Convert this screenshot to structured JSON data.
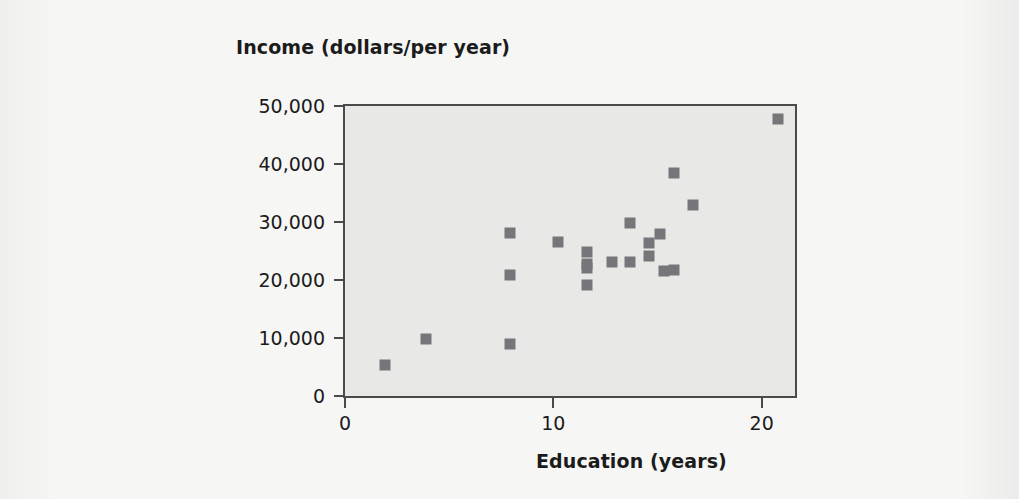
{
  "chart_data": {
    "type": "scatter",
    "title": "Income (dollars/per year)",
    "xlabel": "Education (years)",
    "ylabel": "Income (dollars/per year)",
    "xlim": [
      0,
      21.6
    ],
    "ylim": [
      0,
      50000
    ],
    "grid": false,
    "legend": null,
    "marker": "square",
    "marker_color": "#76767a",
    "plot_background": "#e8e8e7",
    "axis_color": "#4a4a4a",
    "xticks": [
      {
        "value": 0,
        "label": "0"
      },
      {
        "value": 10,
        "label": "10"
      },
      {
        "value": 20,
        "label": "20"
      }
    ],
    "yticks": [
      {
        "value": 0,
        "label": "0"
      },
      {
        "value": 10000,
        "label": "10,000"
      },
      {
        "value": 20000,
        "label": "20,000"
      },
      {
        "value": 30000,
        "label": "30,000"
      },
      {
        "value": 40000,
        "label": "40,000"
      },
      {
        "value": 50000,
        "label": "50,000"
      }
    ],
    "points": [
      {
        "x": 1.9,
        "y": 5300
      },
      {
        "x": 3.9,
        "y": 9800
      },
      {
        "x": 7.9,
        "y": 28100
      },
      {
        "x": 7.9,
        "y": 20900
      },
      {
        "x": 7.9,
        "y": 8900
      },
      {
        "x": 10.2,
        "y": 26500
      },
      {
        "x": 11.6,
        "y": 24900
      },
      {
        "x": 11.6,
        "y": 22700
      },
      {
        "x": 11.6,
        "y": 22000
      },
      {
        "x": 11.6,
        "y": 19200
      },
      {
        "x": 12.8,
        "y": 23100
      },
      {
        "x": 13.7,
        "y": 29900
      },
      {
        "x": 13.7,
        "y": 23100
      },
      {
        "x": 14.6,
        "y": 26300
      },
      {
        "x": 14.6,
        "y": 24200
      },
      {
        "x": 15.1,
        "y": 28000
      },
      {
        "x": 15.3,
        "y": 21500
      },
      {
        "x": 15.8,
        "y": 38400
      },
      {
        "x": 15.8,
        "y": 21700
      },
      {
        "x": 16.7,
        "y": 32900
      },
      {
        "x": 20.8,
        "y": 47700
      }
    ]
  }
}
